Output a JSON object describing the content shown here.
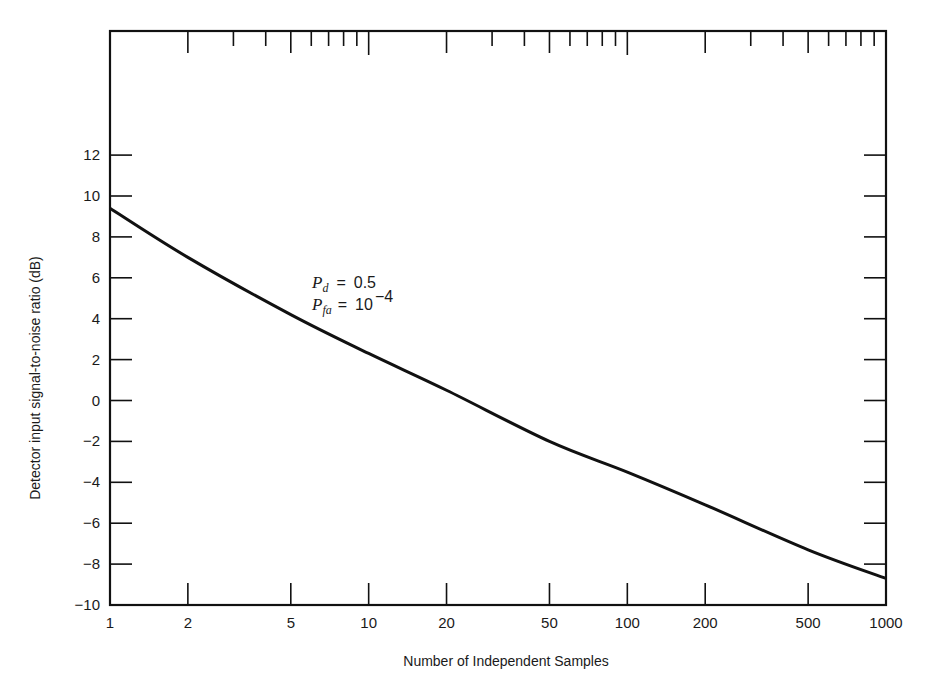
{
  "chart_data": {
    "type": "line",
    "title": "",
    "xlabel": "Number of Independent Samples",
    "ylabel": "Detector input signal-to-noise ratio (dB)",
    "xscale": "log",
    "xlim": [
      1,
      1000
    ],
    "ylim": [
      -10,
      12
    ],
    "x_ticks": [
      1,
      2,
      5,
      10,
      20,
      50,
      100,
      200,
      500,
      1000
    ],
    "x_tick_labels": [
      "1",
      "2",
      "5",
      "10",
      "20",
      "50",
      "100",
      "200",
      "500",
      "1000"
    ],
    "y_ticks": [
      -10,
      -8,
      -6,
      -4,
      -2,
      0,
      2,
      4,
      6,
      8,
      10,
      12
    ],
    "y_tick_labels": [
      "−10",
      "−8",
      "−6",
      "−4",
      "−2",
      "0",
      "2",
      "4",
      "6",
      "8",
      "10",
      "12"
    ],
    "grid": false,
    "legend": null,
    "series": [
      {
        "name": "Pd = 0.5, Pfa = 1e-4",
        "x": [
          1,
          2,
          5,
          10,
          20,
          50,
          100,
          200,
          500,
          1000
        ],
        "values": [
          9.4,
          7.0,
          4.2,
          2.3,
          0.5,
          -2.0,
          -3.5,
          -5.1,
          -7.3,
          -8.7
        ]
      }
    ],
    "annotations": [
      {
        "text": "P_d = 0.5",
        "x": 12,
        "y": 5.8
      },
      {
        "text": "P_fa = 10^-4",
        "x": 12,
        "y": 4.8
      }
    ]
  },
  "annotation": {
    "pd_symbol": "P",
    "pd_sub": "d",
    "pd_eq": "=",
    "pd_value": "0.5",
    "pfa_symbol": "P",
    "pfa_sub": "fa",
    "pfa_eq": "=",
    "pfa_base": "10",
    "pfa_exp": "−4"
  },
  "axes": {
    "xlabel": "Number of Independent Samples",
    "ylabel": "Detector input signal-to-noise ratio (dB)"
  }
}
